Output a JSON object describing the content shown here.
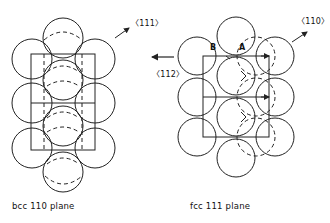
{
  "panels": [
    {
      "id": "bcc",
      "caption": "bcc 110 plane",
      "direction_label": "〈111〉",
      "points": []
    },
    {
      "id": "fcc",
      "caption": "fcc 111 plane",
      "direction_label": "〈110〉",
      "points": [
        "B",
        "A"
      ]
    }
  ],
  "middle_arrow": {
    "direction_label": "〈112〉"
  },
  "colors": {
    "line": "#222222",
    "background": "#ffffff"
  }
}
